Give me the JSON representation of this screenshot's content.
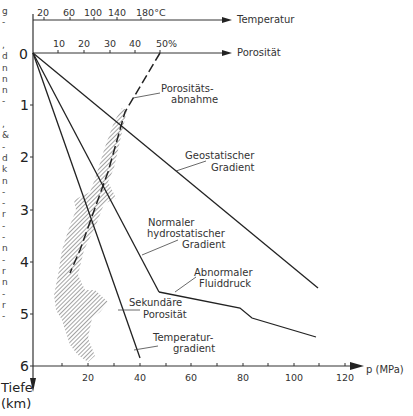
{
  "chart_data": {
    "type": "line",
    "title": "",
    "xlabel": "p (MPa)",
    "ylabel": "Tiefe (km)",
    "x_ticks": [
      20,
      40,
      60,
      80,
      100,
      120
    ],
    "y_ticks": [
      0,
      1,
      2,
      3,
      4,
      5,
      6
    ],
    "xlim": [
      0,
      128
    ],
    "ylim": [
      6,
      0
    ],
    "top_axes": [
      {
        "name": "Temperatur",
        "unit": "°C",
        "ticks": [
          "20",
          "60",
          "100",
          "140",
          "180°C"
        ]
      },
      {
        "name": "Porosität",
        "unit": "%",
        "ticks": [
          "10",
          "20",
          "30",
          "40",
          "50%"
        ]
      }
    ],
    "series": [
      {
        "name": "Geostatischer Gradient",
        "points": [
          [
            0,
            0
          ],
          [
            110,
            4.5
          ]
        ]
      },
      {
        "name": "Normaler hydrostatischer Gradient",
        "points": [
          [
            0,
            0
          ],
          [
            48,
            4.6
          ]
        ]
      },
      {
        "name": "Abnormaler Fluiddruck",
        "points": [
          [
            48,
            4.6
          ],
          [
            79,
            4.9
          ],
          [
            84,
            5.1
          ],
          [
            109,
            5.45
          ]
        ]
      },
      {
        "name": "Temperaturgradient",
        "points": [
          [
            0,
            0
          ],
          [
            41,
            5.85
          ]
        ]
      },
      {
        "name": "Porositätsabnahme",
        "style": "dashed",
        "points": [
          [
            50,
            0
          ],
          [
            33,
            1.2
          ],
          [
            23,
            2.3
          ],
          [
            11,
            4.2
          ]
        ]
      },
      {
        "name": "Sekundäre Porosität",
        "style": "hatched-area",
        "depth_range_km": [
          4.3,
          5.9
        ]
      }
    ],
    "annotations": [
      "Porositäts-abnahme",
      "Geostatischer Gradient",
      "Normaler hydrostatischer Gradient",
      "Abnormaler Fluiddruck",
      "Sekundäre Porosität",
      "Temperatur-gradient"
    ]
  },
  "labels": {
    "temp_axis": "Temperatur",
    "por_axis": "Porosität",
    "x_axis": "p (MPa)",
    "y_axis_1": "Tiefe",
    "y_axis_2": "(km)",
    "poro_1": "Porositäts-",
    "poro_2": "abnahme",
    "geo_1": "Geostatischer",
    "geo_2": "Gradient",
    "hyd_1": "Normaler",
    "hyd_2": "hydrostatischer",
    "hyd_3": "Gradient",
    "abn_1": "Abnormaler",
    "abn_2": "Fluiddruck",
    "sek_1": "Sekundäre",
    "sek_2": "Porosität",
    "tmp_1": "Temperatur-",
    "tmp_2": "gradient"
  },
  "ticks": {
    "temp": [
      "20",
      "60",
      "100",
      "140",
      "180°C"
    ],
    "por": [
      "10",
      "20",
      "30",
      "40",
      "50%"
    ],
    "x": [
      "20",
      "40",
      "60",
      "80",
      "100",
      "120"
    ],
    "y": [
      "0",
      "1",
      "2",
      "3",
      "4",
      "5",
      "6"
    ]
  },
  "margin_text": [
    "g",
    "-",
    "",
    ",",
    "d",
    "n",
    "n",
    "n",
    "-",
    "",
    ",",
    "&",
    "-",
    "d",
    "k",
    "n",
    "-",
    "-",
    "r",
    "-",
    "-",
    "n",
    "-",
    "r",
    "n",
    "-",
    "r",
    "-"
  ]
}
